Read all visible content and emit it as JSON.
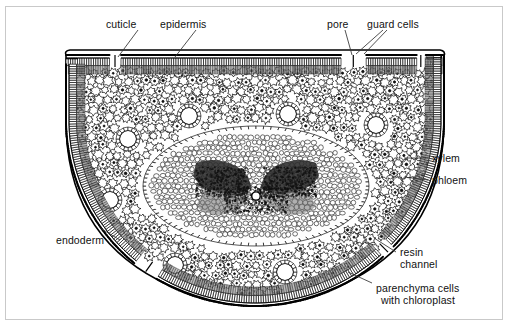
{
  "figure": {
    "border_color": "#c9c9c9",
    "background_color": "#ffffff",
    "ink_color": "#000000"
  },
  "labels": {
    "cuticle": "cuticle",
    "epidermis": "epidermis",
    "pore": "pore",
    "guard_cells": "guard cells",
    "xylem": "xylem",
    "phloem": "phloem",
    "endoderm": "endoderm",
    "resin_channel_line1": "resin",
    "resin_channel_line2": "channel",
    "parenchyma_line1": "parenchyma cells",
    "parenchyma_line2": "with chloroplast"
  },
  "structures": {
    "outline": "semicircular D-shaped needle, flat top, rounded bottom",
    "epidermis_segments": 7,
    "resin_channels": 7,
    "vascular_bundles": 2,
    "stomatal_notches": 2
  },
  "palette": {
    "cell_wall": "#111111",
    "cortex_fill": "#ffffff",
    "epidermis_fill": "#585858",
    "vascular_dark": "#1a1a1a",
    "stele_fill": "#fbfbfb",
    "resin_channel_fill": "#ffffff"
  }
}
